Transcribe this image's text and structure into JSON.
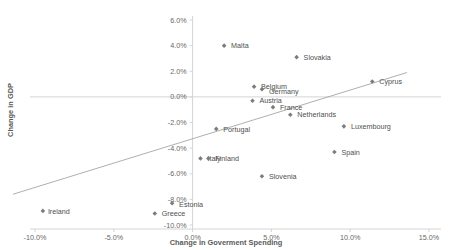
{
  "chart_data": {
    "type": "scatter",
    "title": "",
    "xlabel": "Change in Goverment Spending",
    "ylabel": "Change in GDP",
    "xlim": [
      -11.5,
      15.5
    ],
    "ylim": [
      -10.5,
      6.5
    ],
    "xticks": [
      "-10.0%",
      "-5.0%",
      "0.0%",
      "5.0%",
      "10.0%",
      "15.0%"
    ],
    "xtick_values": [
      -10,
      -5,
      0,
      5,
      10,
      15
    ],
    "yticks": [
      "6.0%",
      "4.0%",
      "2.0%",
      "0.0%",
      "-2.0%",
      "-4.0%",
      "-6.0%",
      "-8.0%",
      "-10.0%"
    ],
    "ytick_values": [
      6,
      4,
      2,
      0,
      -2,
      -4,
      -6,
      -8,
      -10
    ],
    "grid": false,
    "legend": "none",
    "marker_color": "#7c7c7c",
    "trendline_color": "#9a9a9a",
    "axis_color": "#d4d4d4",
    "trendline": {
      "x_start": -11.4,
      "y_start": -7.6,
      "x_end": 13.6,
      "y_end": 1.9
    },
    "points": [
      {
        "name": "Malta",
        "x": 2.0,
        "y": 4.0,
        "label_dx": 7,
        "label_dy": 2.6
      },
      {
        "name": "Slovakia",
        "x": 6.6,
        "y": 3.1,
        "label_dx": 7,
        "label_dy": 2.6
      },
      {
        "name": "Cyprus",
        "x": 11.4,
        "y": 1.2,
        "label_dx": 7,
        "label_dy": 2.6
      },
      {
        "name": "Belgium",
        "x": 3.9,
        "y": 0.8,
        "label_dx": 7,
        "label_dy": 2.6
      },
      {
        "name": "Germany",
        "x": 4.4,
        "y": 0.6,
        "label_dx": 7,
        "label_dy": 4.4
      },
      {
        "name": "Austria",
        "x": 3.8,
        "y": -0.3,
        "label_dx": 7,
        "label_dy": 2.6
      },
      {
        "name": "France",
        "x": 5.1,
        "y": -0.8,
        "label_dx": 7,
        "label_dy": 2.6
      },
      {
        "name": "Netherlands",
        "x": 6.2,
        "y": -1.4,
        "label_dx": 7,
        "label_dy": 2.6
      },
      {
        "name": "Luxembourg",
        "x": 9.6,
        "y": -2.3,
        "label_dx": 7,
        "label_dy": 2.6
      },
      {
        "name": "Portugal",
        "x": 1.5,
        "y": -2.5,
        "label_dx": 7,
        "label_dy": 2.6
      },
      {
        "name": "Spain",
        "x": 9.0,
        "y": -4.3,
        "label_dx": 7,
        "label_dy": 2.6
      },
      {
        "name": "Italy",
        "x": 0.5,
        "y": -4.8,
        "label_dx": 7,
        "label_dy": 2.6
      },
      {
        "name": "Finland",
        "x": 1.0,
        "y": -4.8,
        "label_dx": 7,
        "label_dy": 2.2
      },
      {
        "name": "Slovenia",
        "x": 4.4,
        "y": -6.2,
        "label_dx": 7,
        "label_dy": 2.6
      },
      {
        "name": "Estonia",
        "x": -1.3,
        "y": -8.3,
        "label_dx": 7,
        "label_dy": 3.4
      },
      {
        "name": "Greece",
        "x": -2.4,
        "y": -9.1,
        "label_dx": 7,
        "label_dy": 2.6
      },
      {
        "name": "Ireland",
        "x": -9.5,
        "y": -8.9,
        "label_dx": 5,
        "label_dy": 2.6
      }
    ]
  }
}
